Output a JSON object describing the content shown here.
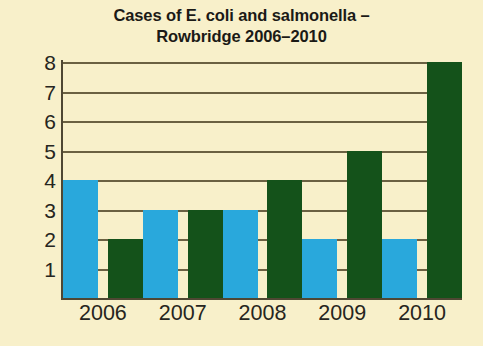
{
  "chart_data": {
    "type": "bar",
    "title": "Cases of E. coli and salmonella – Rowbridge 2006–2010",
    "title_lines": [
      "Cases of E. coli and salmonella –",
      "Rowbridge 2006–2010"
    ],
    "xlabel": "",
    "ylabel": "",
    "categories": [
      "2006",
      "2007",
      "2008",
      "2009",
      "2010"
    ],
    "series": [
      {
        "name": "E. coli",
        "color": "#29a8dc",
        "values": [
          4,
          3,
          3,
          2,
          2
        ]
      },
      {
        "name": "salmonella",
        "color": "#14521a",
        "values": [
          2,
          3,
          4,
          5,
          8
        ]
      }
    ],
    "ylim": [
      0,
      8
    ],
    "ytick_labels": [
      "8",
      "7",
      "6",
      "5",
      "4",
      "3",
      "2",
      "1"
    ],
    "ytick_values": [
      8,
      7,
      6,
      5,
      4,
      3,
      2,
      1
    ],
    "grid": true,
    "legend": "none",
    "background_color": "#f8f0ca",
    "axis_color": "#4f4733",
    "gridline_color": "#6b6142"
  }
}
